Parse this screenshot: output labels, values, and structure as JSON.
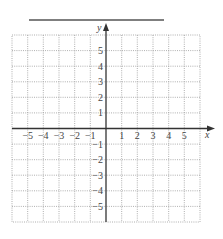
{
  "diagram": {
    "type": "coordinate-plane",
    "title_line": "",
    "x_axis": {
      "label": "x",
      "min": -6,
      "max": 6,
      "tick_labels": [
        "−5",
        "−4",
        "−3",
        "−2",
        "−1",
        "1",
        "2",
        "3",
        "4",
        "5"
      ],
      "tick_values": [
        -5,
        -4,
        -3,
        -2,
        -1,
        1,
        2,
        3,
        4,
        5
      ]
    },
    "y_axis": {
      "label": "y",
      "min": -6,
      "max": 6,
      "tick_labels": [
        "5",
        "4",
        "3",
        "2",
        "1",
        "−1",
        "−2",
        "−3",
        "−4",
        "−5"
      ],
      "tick_values": [
        5,
        4,
        3,
        2,
        1,
        -1,
        -2,
        -3,
        -4,
        -5
      ]
    },
    "grid": {
      "style": "dotted",
      "cells_x": 12,
      "cells_y": 12
    },
    "colors": {
      "axis": "#333333",
      "grid": "#9a9a9a",
      "text": "#444444",
      "title_line": "#555555"
    }
  }
}
